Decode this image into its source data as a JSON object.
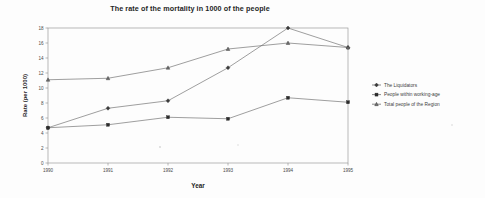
{
  "chart_data": {
    "type": "line",
    "title": "The rate of the mortality in 1000 of the people",
    "xlabel": "Year",
    "ylabel": "Rate (per 1000)",
    "categories": [
      "1990",
      "1991",
      "1992",
      "1993",
      "1994",
      "1995"
    ],
    "x": [
      1990,
      1991,
      1992,
      1993,
      1994,
      1995
    ],
    "xlim": [
      1990,
      1995
    ],
    "ylim": [
      0,
      18
    ],
    "yticks": [
      0,
      2,
      4,
      6,
      8,
      10,
      12,
      14,
      16,
      18
    ],
    "ytick_labels": [
      "0",
      "2",
      "4",
      "6",
      "8",
      "10",
      "12",
      "14",
      "16",
      "18"
    ],
    "xtick_labels": [
      "1990",
      "1991",
      "1992",
      "1993",
      "1994",
      "1995"
    ],
    "grid": false,
    "legend_position": "right",
    "series": [
      {
        "name": "The Liquidators",
        "marker": "diamond",
        "values": [
          4.7,
          7.3,
          8.3,
          12.7,
          18.0,
          15.4
        ]
      },
      {
        "name": "People within working-age",
        "marker": "square",
        "values": [
          4.7,
          5.1,
          6.1,
          5.9,
          8.7,
          8.1
        ]
      },
      {
        "name": "Total people of the Region",
        "marker": "triangle",
        "values": [
          11.1,
          11.3,
          12.7,
          15.2,
          16.0,
          15.4
        ]
      }
    ]
  },
  "colors": {
    "line": "#6a6a6a",
    "marker": "#2c2c2c",
    "axis": "#8d8d8d",
    "text": "#3d3d3d",
    "background": "#fdfdfd"
  }
}
